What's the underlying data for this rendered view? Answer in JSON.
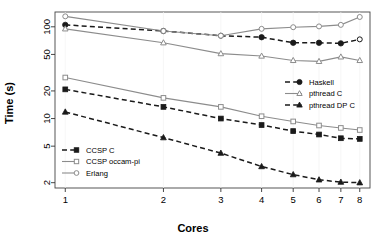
{
  "chart_data": {
    "type": "line",
    "title": "",
    "xlabel": "Cores",
    "ylabel": "Time (s)",
    "xscale": "log",
    "yscale": "log",
    "grid": false,
    "x": [
      1,
      2,
      3,
      4,
      5,
      6,
      7,
      8
    ],
    "xticks": [
      "1",
      "2",
      "3",
      "4",
      "5",
      "6",
      "7",
      "8"
    ],
    "yticks": [
      "2",
      "5",
      "10",
      "20",
      "50",
      "100"
    ],
    "ytick_values": [
      2,
      5,
      10,
      20,
      50,
      100
    ],
    "xlim": [
      0.93,
      8.6
    ],
    "ylim": [
      1.75,
      145
    ],
    "series": [
      {
        "name": "Haskell",
        "color": "#1a1a1a",
        "dash": "dashed",
        "marker": "circle-filled",
        "values": [
          105,
          90,
          80,
          77,
          67,
          67,
          66,
          73
        ]
      },
      {
        "name": "pthread C",
        "color": "#8c8c8c",
        "dash": "solid",
        "marker": "triangle-open",
        "values": [
          95,
          67,
          51,
          48,
          43,
          42,
          47,
          43
        ]
      },
      {
        "name": "pthread DP C",
        "color": "#1a1a1a",
        "dash": "dashed",
        "marker": "triangle-filled",
        "values": [
          11.8,
          6.2,
          4.2,
          3.0,
          2.45,
          2.15,
          2.03,
          2.0
        ]
      },
      {
        "name": "CCSP C",
        "color": "#1a1a1a",
        "dash": "dashed",
        "marker": "square-filled",
        "values": [
          20.8,
          13.4,
          10.0,
          8.5,
          7.3,
          6.7,
          6.1,
          6.0
        ]
      },
      {
        "name": "CCSP occam-pi",
        "color": "#8c8c8c",
        "dash": "solid",
        "marker": "square-open",
        "values": [
          28,
          16.8,
          13.4,
          10.6,
          9.3,
          8.4,
          7.9,
          7.5
        ]
      },
      {
        "name": "Erlang",
        "color": "#8c8c8c",
        "dash": "solid",
        "marker": "circle-open",
        "values": [
          130,
          90,
          80,
          95,
          99,
          101,
          105,
          128
        ]
      }
    ],
    "legends": [
      {
        "position": "bottom-left",
        "entries": [
          {
            "label": "CCSP C",
            "color": "#1a1a1a",
            "dash": "dashed",
            "marker": "square-filled"
          },
          {
            "label": "CCSP occam-pi",
            "color": "#8c8c8c",
            "dash": "solid",
            "marker": "square-open"
          },
          {
            "label": "Erlang",
            "color": "#8c8c8c",
            "dash": "solid",
            "marker": "circle-open"
          }
        ]
      },
      {
        "position": "right-middle",
        "entries": [
          {
            "label": "Haskell",
            "color": "#1a1a1a",
            "dash": "dashed",
            "marker": "circle-filled"
          },
          {
            "label": "pthread C",
            "color": "#8c8c8c",
            "dash": "solid",
            "marker": "triangle-open"
          },
          {
            "label": "pthread DP C",
            "color": "#1a1a1a",
            "dash": "dashed",
            "marker": "triangle-filled"
          }
        ]
      }
    ]
  }
}
